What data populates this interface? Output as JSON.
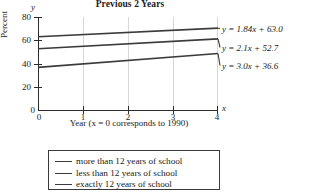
{
  "chart_data": {
    "type": "line",
    "title": "Previous 2 Years",
    "xlabel": "Year (x = 0 corresponds to 1990)",
    "ylabel": "Percent",
    "axis_name_x": "x",
    "axis_name_y": "y",
    "xlim": [
      0,
      4
    ],
    "ylim": [
      0,
      80
    ],
    "xticks": [
      "0",
      "1",
      "2",
      "3",
      "4"
    ],
    "xtick_values": [
      0,
      1,
      2,
      3,
      4
    ],
    "yticks": [
      "0",
      "20",
      "40",
      "60",
      "80"
    ],
    "ytick_values": [
      0,
      20,
      40,
      60,
      80
    ],
    "grid": "vertical",
    "legend_position": "below-plot",
    "series": [
      {
        "name": "more than 12 years of school",
        "equation": "y = 1.84x + 63.0",
        "slope": 1.84,
        "intercept": 63.0,
        "x": [
          0,
          4
        ],
        "values": [
          63.0,
          70.36
        ],
        "color": "#3b3b3b"
      },
      {
        "name": "less than 12 years of school",
        "equation": "y = 2.1x + 52.7",
        "slope": 2.1,
        "intercept": 52.7,
        "x": [
          0,
          4
        ],
        "values": [
          52.7,
          61.1
        ],
        "color": "#3b3b3b"
      },
      {
        "name": "exactly 12 years of school",
        "equation": "y = 3.0x + 36.6",
        "slope": 3.0,
        "intercept": 36.6,
        "x": [
          0,
          4
        ],
        "values": [
          36.6,
          48.6
        ],
        "color": "#3b3b3b"
      }
    ],
    "annotations": [
      "y = 1.84x + 63.0",
      "y = 2.1x + 52.7",
      "y = 3.0x + 36.6"
    ]
  },
  "legend": {
    "items": [
      {
        "label": "more than 12 years of school"
      },
      {
        "label": "less than 12 years of school"
      },
      {
        "label": "exactly 12 years of school"
      }
    ]
  },
  "colors": {
    "line": "#3b3b3b",
    "axis": "#2b2b2b",
    "grid": "#d8d8d8",
    "text": "#1a1a1a",
    "background": "#ffffff"
  }
}
